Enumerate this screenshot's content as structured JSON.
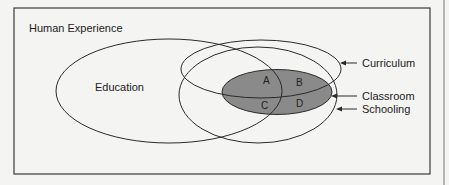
{
  "diagram": {
    "frame_title": "Human Experience",
    "sets": [
      {
        "id": "education",
        "label": "Education"
      },
      {
        "id": "curriculum",
        "label": "Curriculum"
      },
      {
        "id": "classroom",
        "label": "Classroom"
      },
      {
        "id": "schooling",
        "label": "Schooling"
      }
    ],
    "regions": [
      "A",
      "B",
      "C",
      "D"
    ],
    "colors": {
      "background": "#f4f4f2",
      "stroke": "#2a2a2a",
      "classroom_fill": "#8a8a8a"
    }
  }
}
